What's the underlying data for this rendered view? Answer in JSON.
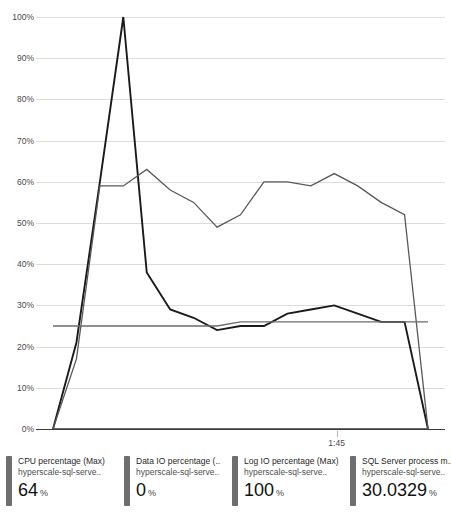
{
  "chart_data": {
    "type": "line",
    "title": "",
    "xlabel": "",
    "ylabel": "",
    "ylim": [
      0,
      100
    ],
    "ytick_labels": [
      "0%",
      "10%",
      "20%",
      "30%",
      "40%",
      "50%",
      "60%",
      "70%",
      "80%",
      "90%",
      "100%"
    ],
    "ytick_values": [
      0,
      10,
      20,
      30,
      40,
      50,
      60,
      70,
      80,
      90,
      100
    ],
    "xtick_labels": [
      "1:45"
    ],
    "xtick_positions": [
      0.735
    ],
    "grid": true,
    "legend_position": "bottom",
    "x": [
      0,
      1,
      2,
      3,
      4,
      5,
      6,
      7,
      8,
      9,
      10,
      11,
      12,
      13,
      14,
      15,
      16
    ],
    "series": [
      {
        "name": "CPU percentage (Max)",
        "color": "#1a1a1a",
        "values": [
          0,
          21,
          60,
          100,
          38,
          29,
          27,
          24,
          25,
          25,
          28,
          29,
          30,
          28,
          26,
          26,
          0
        ]
      },
      {
        "name": "Data IO percentage (Max)",
        "color": "#3a3a3a",
        "values": [
          0,
          0,
          0,
          0,
          0,
          0,
          0,
          0,
          0,
          0,
          0,
          0,
          0,
          0,
          0,
          0,
          0
        ]
      },
      {
        "name": "Log IO percentage (Max)",
        "color": "#595959",
        "values": [
          0,
          17,
          59,
          59,
          63,
          58,
          55,
          49,
          52,
          60,
          60,
          59,
          62,
          59,
          55,
          52,
          0
        ]
      },
      {
        "name": "SQL Server process memory percent (Max)",
        "color": "#6b6b6b",
        "values": [
          25,
          25,
          25,
          25,
          25,
          25,
          25,
          25,
          26,
          26,
          26,
          26,
          26,
          26,
          26,
          26,
          26
        ]
      }
    ]
  },
  "legend": {
    "items": [
      {
        "title": "CPU percentage (Max)",
        "resource": "hyperscale-sql-serve..",
        "value": "64",
        "unit": "%",
        "swatch": "#6e6e6e"
      },
      {
        "title": "Data IO percentage (..",
        "resource": "hyperscale-sql-serve..",
        "value": "0",
        "unit": "%",
        "swatch": "#6e6e6e"
      },
      {
        "title": "Log IO percentage (Max)",
        "resource": "hyperscale-sql-serve..",
        "value": "100",
        "unit": "%",
        "swatch": "#6e6e6e"
      },
      {
        "title": "SQL Server process m..",
        "resource": "hyperscale-sql-serve..",
        "value": "30.0329",
        "unit": "%",
        "swatch": "#6e6e6e"
      }
    ]
  },
  "axis": {
    "top_caption": ""
  }
}
